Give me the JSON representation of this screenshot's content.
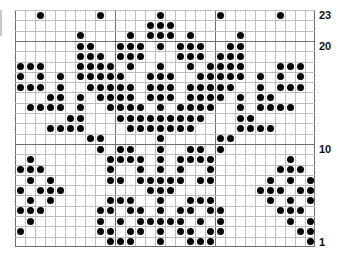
{
  "chart_data": {
    "type": "heatmap",
    "title": "",
    "columns": 30,
    "rows": 23,
    "row_labels": [
      {
        "row": 23,
        "label": "23"
      },
      {
        "row": 20,
        "label": "20"
      },
      {
        "row": 10,
        "label": "10"
      },
      {
        "row": 1,
        "label": "1"
      }
    ],
    "grid_thick_every": 10,
    "filled_cells_by_row": {
      "23": [
        2,
        8,
        14,
        20,
        26
      ],
      "22": [
        13,
        14,
        15
      ],
      "21": [
        6,
        11,
        13,
        14,
        15,
        17,
        22
      ],
      "20": [
        6,
        7,
        10,
        11,
        12,
        14,
        16,
        17,
        18,
        21,
        22
      ],
      "19": [
        6,
        7,
        8,
        10,
        11,
        12,
        16,
        17,
        18,
        20,
        21,
        22
      ],
      "18": [
        0,
        1,
        2,
        6,
        7,
        8,
        9,
        11,
        14,
        17,
        19,
        20,
        21,
        22,
        26,
        27,
        28
      ],
      "17": [
        0,
        2,
        4,
        6,
        7,
        8,
        9,
        10,
        13,
        14,
        15,
        18,
        19,
        20,
        21,
        22,
        24,
        26,
        28
      ],
      "16": [
        0,
        1,
        2,
        4,
        7,
        8,
        9,
        10,
        11,
        13,
        14,
        15,
        17,
        18,
        19,
        20,
        21,
        24,
        26,
        27,
        28
      ],
      "15": [
        3,
        4,
        6,
        8,
        9,
        10,
        11,
        13,
        14,
        15,
        17,
        18,
        19,
        20,
        22,
        24,
        25
      ],
      "14": [
        1,
        2,
        3,
        4,
        6,
        9,
        10,
        11,
        12,
        14,
        16,
        17,
        18,
        19,
        22,
        24,
        25,
        26,
        27
      ],
      "13": [
        5,
        6,
        10,
        11,
        12,
        13,
        14,
        15,
        16,
        17,
        18,
        22,
        23
      ],
      "12": [
        3,
        4,
        5,
        6,
        11,
        12,
        13,
        14,
        15,
        16,
        17,
        22,
        23,
        24,
        25
      ],
      "11": [
        7,
        8,
        14,
        20,
        21
      ],
      "10": [
        8,
        10,
        11,
        14,
        17,
        18,
        20
      ],
      "9": [
        1,
        9,
        10,
        11,
        12,
        14,
        16,
        17,
        18,
        19,
        27
      ],
      "8": [
        0,
        1,
        2,
        9,
        12,
        14,
        16,
        19,
        26,
        27,
        28
      ],
      "7": [
        1,
        3,
        9,
        10,
        12,
        13,
        14,
        15,
        16,
        18,
        19,
        25,
        27,
        29
      ],
      "6": [
        0,
        2,
        3,
        4,
        13,
        14,
        15,
        24,
        25,
        26,
        28,
        29
      ],
      "5": [
        1,
        3,
        9,
        10,
        11,
        14,
        17,
        18,
        19,
        25,
        27,
        29
      ],
      "4": [
        0,
        1,
        2,
        8,
        9,
        11,
        12,
        14,
        16,
        17,
        19,
        20,
        26,
        27,
        28
      ],
      "3": [
        1,
        8,
        10,
        12,
        13,
        14,
        15,
        16,
        18,
        20,
        27,
        29
      ],
      "2": [
        0,
        8,
        9,
        11,
        12,
        14,
        16,
        17,
        19,
        20,
        28,
        29
      ],
      "1": [
        9,
        10,
        11,
        14,
        17,
        18,
        19,
        29
      ]
    },
    "legend": [],
    "grid": true
  },
  "labels": {
    "row23": "23",
    "row20": "20",
    "row10": "10",
    "row1": "1"
  },
  "colors": {
    "dot": "#000000",
    "grid_line": "#bdbdbd",
    "grid_thick": "#6e6e6e"
  }
}
